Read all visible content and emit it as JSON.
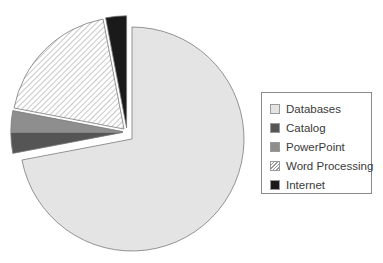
{
  "chart_data": {
    "type": "pie",
    "title": "",
    "start_angle_deg": 0,
    "direction": "clockwise",
    "categories": [
      "Databases",
      "Catalog",
      "PowerPoint",
      "Word Processing",
      "Internet"
    ],
    "values": [
      72,
      3,
      3,
      19,
      3
    ],
    "unit": "%",
    "exploded": [
      "Catalog",
      "PowerPoint",
      "Word Processing",
      "Internet"
    ],
    "slices": [
      {
        "label": "Databases",
        "value": 72,
        "fill": "#e4e4e4",
        "pattern": "solid"
      },
      {
        "label": "Catalog",
        "value": 3,
        "fill": "#555555",
        "pattern": "solid"
      },
      {
        "label": "PowerPoint",
        "value": 3,
        "fill": "#8e8e8e",
        "pattern": "solid"
      },
      {
        "label": "Word Processing",
        "value": 19,
        "fill": "#ffffff",
        "pattern": "diagonal-hatch"
      },
      {
        "label": "Internet",
        "value": 3,
        "fill": "#1a1a1a",
        "pattern": "solid"
      }
    ],
    "legend_position": "right"
  },
  "legend": {
    "items": [
      {
        "label": "Databases",
        "swatch": "#e4e4e4",
        "pattern": "solid"
      },
      {
        "label": "Catalog",
        "swatch": "#555555",
        "pattern": "solid"
      },
      {
        "label": "PowerPoint",
        "swatch": "#8e8e8e",
        "pattern": "solid"
      },
      {
        "label": "Word Processing",
        "swatch": "#ffffff",
        "pattern": "diagonal-hatch"
      },
      {
        "label": "Internet",
        "swatch": "#1a1a1a",
        "pattern": "solid"
      }
    ]
  },
  "colors": {
    "outline": "#7a7a7a",
    "hatch_line": "#9a9a9a"
  }
}
